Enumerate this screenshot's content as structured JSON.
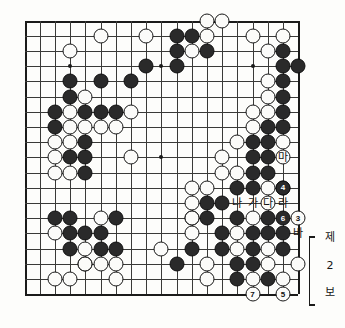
{
  "diagram": {
    "type": "go-board",
    "size": 19,
    "caption_lines": [
      "제",
      "2",
      "보"
    ],
    "caption_text": "제 2 보"
  },
  "board": {
    "star_points": [
      {
        "col": 4,
        "row": 4
      },
      {
        "col": 10,
        "row": 4
      },
      {
        "col": 16,
        "row": 4
      },
      {
        "col": 4,
        "row": 10
      },
      {
        "col": 10,
        "row": 10
      },
      {
        "col": 16,
        "row": 10
      },
      {
        "col": 4,
        "row": 16
      },
      {
        "col": 10,
        "row": 16
      },
      {
        "col": 16,
        "row": 16
      }
    ],
    "black_stones": [
      {
        "col": 11,
        "row": 2
      },
      {
        "col": 12,
        "row": 2
      },
      {
        "col": 11,
        "row": 3
      },
      {
        "col": 13,
        "row": 3
      },
      {
        "col": 18,
        "row": 3
      },
      {
        "col": 9,
        "row": 4
      },
      {
        "col": 11,
        "row": 4
      },
      {
        "col": 18,
        "row": 4
      },
      {
        "col": 19,
        "row": 4
      },
      {
        "col": 4,
        "row": 5
      },
      {
        "col": 6,
        "row": 5
      },
      {
        "col": 8,
        "row": 5
      },
      {
        "col": 18,
        "row": 5
      },
      {
        "col": 4,
        "row": 6
      },
      {
        "col": 18,
        "row": 6
      },
      {
        "col": 3,
        "row": 7
      },
      {
        "col": 5,
        "row": 7
      },
      {
        "col": 6,
        "row": 7
      },
      {
        "col": 7,
        "row": 7
      },
      {
        "col": 18,
        "row": 7
      },
      {
        "col": 3,
        "row": 8
      },
      {
        "col": 17,
        "row": 8
      },
      {
        "col": 18,
        "row": 8
      },
      {
        "col": 5,
        "row": 9
      },
      {
        "col": 16,
        "row": 9
      },
      {
        "col": 17,
        "row": 9
      },
      {
        "col": 4,
        "row": 10
      },
      {
        "col": 5,
        "row": 10
      },
      {
        "col": 16,
        "row": 10
      },
      {
        "col": 17,
        "row": 10
      },
      {
        "col": 5,
        "row": 11
      },
      {
        "col": 16,
        "row": 11
      },
      {
        "col": 17,
        "row": 11
      },
      {
        "col": 15,
        "row": 12
      },
      {
        "col": 16,
        "row": 12
      },
      {
        "col": 18,
        "row": 12
      },
      {
        "col": 13,
        "row": 13
      },
      {
        "col": 14,
        "row": 13
      },
      {
        "col": 3,
        "row": 14
      },
      {
        "col": 4,
        "row": 14
      },
      {
        "col": 7,
        "row": 14
      },
      {
        "col": 12,
        "row": 14
      },
      {
        "col": 13,
        "row": 14
      },
      {
        "col": 15,
        "row": 14
      },
      {
        "col": 17,
        "row": 14
      },
      {
        "col": 4,
        "row": 15
      },
      {
        "col": 5,
        "row": 15
      },
      {
        "col": 6,
        "row": 15
      },
      {
        "col": 14,
        "row": 15
      },
      {
        "col": 16,
        "row": 15
      },
      {
        "col": 17,
        "row": 15
      },
      {
        "col": 18,
        "row": 15
      },
      {
        "col": 4,
        "row": 16
      },
      {
        "col": 6,
        "row": 16
      },
      {
        "col": 7,
        "row": 16
      },
      {
        "col": 12,
        "row": 16
      },
      {
        "col": 14,
        "row": 16
      },
      {
        "col": 16,
        "row": 16
      },
      {
        "col": 18,
        "row": 16
      },
      {
        "col": 5,
        "row": 17
      },
      {
        "col": 11,
        "row": 17
      },
      {
        "col": 15,
        "row": 17
      },
      {
        "col": 16,
        "row": 17
      },
      {
        "col": 15,
        "row": 18
      },
      {
        "col": 17,
        "row": 18
      }
    ],
    "white_stones": [
      {
        "col": 13,
        "row": 1
      },
      {
        "col": 14,
        "row": 1
      },
      {
        "col": 6,
        "row": 2
      },
      {
        "col": 9,
        "row": 2
      },
      {
        "col": 13,
        "row": 2
      },
      {
        "col": 16,
        "row": 2
      },
      {
        "col": 18,
        "row": 2
      },
      {
        "col": 4,
        "row": 3
      },
      {
        "col": 12,
        "row": 3
      },
      {
        "col": 17,
        "row": 3
      },
      {
        "col": 17,
        "row": 5
      },
      {
        "col": 5,
        "row": 6
      },
      {
        "col": 17,
        "row": 6
      },
      {
        "col": 4,
        "row": 7
      },
      {
        "col": 8,
        "row": 7
      },
      {
        "col": 16,
        "row": 7
      },
      {
        "col": 17,
        "row": 7
      },
      {
        "col": 4,
        "row": 8
      },
      {
        "col": 5,
        "row": 8
      },
      {
        "col": 6,
        "row": 8
      },
      {
        "col": 7,
        "row": 8
      },
      {
        "col": 16,
        "row": 8
      },
      {
        "col": 3,
        "row": 9
      },
      {
        "col": 4,
        "row": 9
      },
      {
        "col": 15,
        "row": 9
      },
      {
        "col": 18,
        "row": 9
      },
      {
        "col": 3,
        "row": 10
      },
      {
        "col": 8,
        "row": 10
      },
      {
        "col": 14,
        "row": 10
      },
      {
        "col": 18,
        "row": 10
      },
      {
        "col": 3,
        "row": 11
      },
      {
        "col": 4,
        "row": 11
      },
      {
        "col": 14,
        "row": 11
      },
      {
        "col": 15,
        "row": 11
      },
      {
        "col": 12,
        "row": 12
      },
      {
        "col": 13,
        "row": 12
      },
      {
        "col": 17,
        "row": 12
      },
      {
        "col": 12,
        "row": 13
      },
      {
        "col": 17,
        "row": 13
      },
      {
        "col": 6,
        "row": 14
      },
      {
        "col": 12,
        "row": 14
      },
      {
        "col": 16,
        "row": 14
      },
      {
        "col": 3,
        "row": 15
      },
      {
        "col": 12,
        "row": 15
      },
      {
        "col": 15,
        "row": 15
      },
      {
        "col": 5,
        "row": 16
      },
      {
        "col": 10,
        "row": 16
      },
      {
        "col": 15,
        "row": 16
      },
      {
        "col": 17,
        "row": 16
      },
      {
        "col": 5,
        "row": 17
      },
      {
        "col": 6,
        "row": 17
      },
      {
        "col": 7,
        "row": 17
      },
      {
        "col": 13,
        "row": 17
      },
      {
        "col": 17,
        "row": 17
      },
      {
        "col": 19,
        "row": 17
      },
      {
        "col": 3,
        "row": 18
      },
      {
        "col": 4,
        "row": 18
      },
      {
        "col": 7,
        "row": 18
      },
      {
        "col": 13,
        "row": 18
      },
      {
        "col": 16,
        "row": 18
      },
      {
        "col": 18,
        "row": 18
      }
    ],
    "numbered_stones": [
      {
        "label": "3",
        "color": "white",
        "col": 19,
        "row": 14
      },
      {
        "label": "4",
        "color": "black",
        "col": 18,
        "row": 12
      },
      {
        "label": "5",
        "color": "white",
        "col": 18,
        "row": 19
      },
      {
        "label": "6",
        "color": "black",
        "col": 18,
        "row": 14
      },
      {
        "label": "7",
        "color": "white",
        "col": 16,
        "row": 19
      }
    ],
    "point_labels": [
      {
        "text": "마",
        "col": 18,
        "row": 10
      },
      {
        "text": "나",
        "col": 15,
        "row": 13
      },
      {
        "text": "가",
        "col": 16,
        "row": 13
      },
      {
        "text": "다",
        "col": 17,
        "row": 13
      },
      {
        "text": "라",
        "col": 18,
        "row": 13
      },
      {
        "text": "바",
        "col": 19,
        "row": 15
      }
    ]
  }
}
